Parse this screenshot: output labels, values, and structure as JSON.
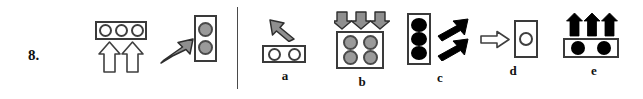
{
  "item": {
    "number": "8.",
    "type": "visual-analogy-multiple-choice"
  },
  "divider": {
    "orientation": "vertical"
  },
  "stimulus": {
    "first": {
      "panel": {
        "shape": "horizontal-rectangle",
        "dots": [
          {
            "fill": "white",
            "name": "circle-hollow"
          },
          {
            "fill": "white",
            "name": "circle-hollow"
          },
          {
            "fill": "white",
            "name": "circle-hollow"
          }
        ]
      },
      "arrows": [
        {
          "direction": "up",
          "style": "hollow-outline"
        },
        {
          "direction": "up",
          "style": "hollow-outline"
        }
      ]
    },
    "second": {
      "arrow": {
        "direction": "up-right",
        "style": "gray-filled"
      },
      "panel": {
        "shape": "vertical-rectangle",
        "dots": [
          {
            "fill": "gray",
            "name": "circle-gray"
          },
          {
            "fill": "gray",
            "name": "circle-gray"
          }
        ]
      }
    }
  },
  "options": [
    {
      "label": "a",
      "arrows": [
        {
          "direction": "up-left",
          "style": "gray-filled"
        }
      ],
      "panel": {
        "shape": "horizontal-rectangle",
        "dots": [
          {
            "fill": "white",
            "name": "circle-hollow"
          },
          {
            "fill": "white",
            "name": "circle-hollow"
          }
        ]
      }
    },
    {
      "label": "b",
      "arrows": [
        {
          "direction": "down",
          "style": "gray-filled"
        },
        {
          "direction": "down",
          "style": "gray-filled"
        },
        {
          "direction": "down",
          "style": "gray-filled"
        }
      ],
      "panel": {
        "shape": "square-2x2",
        "dots": [
          {
            "fill": "gray",
            "name": "circle-gray"
          },
          {
            "fill": "gray",
            "name": "circle-gray"
          },
          {
            "fill": "gray",
            "name": "circle-gray"
          },
          {
            "fill": "gray",
            "name": "circle-gray"
          }
        ]
      }
    },
    {
      "label": "c",
      "arrows": [
        {
          "direction": "up-right",
          "style": "black-filled"
        },
        {
          "direction": "up-right",
          "style": "black-filled"
        }
      ],
      "panel": {
        "shape": "vertical-rectangle",
        "dots": [
          {
            "fill": "black",
            "name": "circle-black"
          },
          {
            "fill": "black",
            "name": "circle-black"
          },
          {
            "fill": "black",
            "name": "circle-black"
          }
        ]
      }
    },
    {
      "label": "d",
      "arrows": [
        {
          "direction": "right",
          "style": "hollow-outline"
        }
      ],
      "panel": {
        "shape": "vertical-rectangle",
        "dots": [
          {
            "fill": "white",
            "name": "circle-hollow"
          }
        ]
      }
    },
    {
      "label": "e",
      "arrows": [
        {
          "direction": "up",
          "style": "black-filled"
        },
        {
          "direction": "up",
          "style": "black-filled"
        },
        {
          "direction": "up",
          "style": "black-filled"
        }
      ],
      "panel": {
        "shape": "horizontal-rectangle",
        "dots": [
          {
            "fill": "black",
            "name": "circle-black"
          },
          {
            "fill": "black",
            "name": "circle-black"
          }
        ]
      }
    }
  ],
  "colors": {
    "ink": "#000000",
    "outline": "#3a3a3a",
    "gray_fill": "#9a9a9a",
    "white_fill": "#ffffff",
    "page_background": "#ffffff"
  }
}
